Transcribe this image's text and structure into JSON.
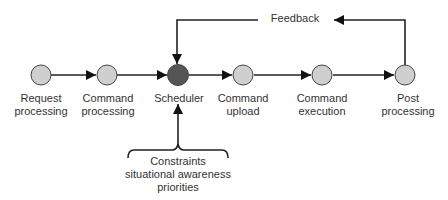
{
  "nodes": [
    {
      "id": "request-processing",
      "line1": "Request",
      "line2": "processing",
      "cx": 41,
      "fill": "#cfcfcf"
    },
    {
      "id": "command-processing",
      "line1": "Command",
      "line2": "processing",
      "cx": 107,
      "fill": "#cfcfcf"
    },
    {
      "id": "scheduler",
      "line1": "Scheduler",
      "line2": "",
      "cx": 178,
      "fill": "#555555"
    },
    {
      "id": "command-upload",
      "line1": "Command",
      "line2": "upload",
      "cx": 243,
      "fill": "#cfcfcf"
    },
    {
      "id": "command-execution",
      "line1": "Command",
      "line2": "execution",
      "cx": 322,
      "fill": "#cfcfcf"
    },
    {
      "id": "post-processing",
      "line1": "Post",
      "line2": "processing",
      "cx": 405,
      "fill": "#cfcfcf"
    }
  ],
  "feedback": {
    "label": "Feedback"
  },
  "constraints": {
    "line1": "Constraints",
    "line2": "situational awareness",
    "line3": "priorities"
  },
  "colors": {
    "stroke": "#222222",
    "node_fill": "#cfcfcf",
    "scheduler_fill": "#555555",
    "text": "#333333"
  }
}
